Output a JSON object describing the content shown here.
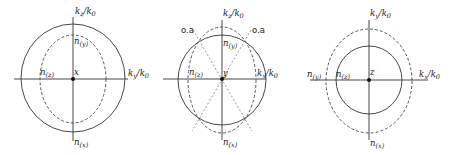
{
  "figure": {
    "panels": [
      {
        "id": "panel-x",
        "vertical_axis_label": "k_z/k_0",
        "horizontal_axis_label": "k_y/k_0",
        "origin_label": "x",
        "top_label": "n_(y)",
        "left_label": "n_(z)",
        "bottom_label": "n_(x)",
        "shapes": [
          "solid circle (outer)",
          "dashed ellipse (inner, vertically elongated)"
        ]
      },
      {
        "id": "panel-y",
        "vertical_axis_label": "k_z/k_0",
        "horizontal_axis_label": "k_x/k_0",
        "origin_label": "y",
        "top_label": "n_(y)",
        "left_label": "n_(z)",
        "bottom_label": "n_(x)",
        "optic_axis_labels": [
          "o.a",
          "o.a"
        ],
        "shapes": [
          "solid circle",
          "dashed ellipse (vertically elongated)",
          "two dotted optic-axis lines through origin"
        ]
      },
      {
        "id": "panel-z",
        "vertical_axis_label": "k_y/k_0",
        "horizontal_axis_label": "k_x/k_0",
        "origin_label": "z",
        "left_outer_label": "n_(y)",
        "left_label": "n_(z)",
        "bottom_label": "n_(x)",
        "shapes": [
          "solid circle (inner)",
          "dashed ellipse (outer)"
        ]
      }
    ],
    "text": {
      "k": "k",
      "slash_k0": "/k",
      "zero": "0",
      "n": "n",
      "sub_x": "(x)",
      "sub_y": "(y)",
      "sub_z": "(z)",
      "z": "z",
      "y": "y",
      "x": "x",
      "oa": "o.a"
    }
  }
}
